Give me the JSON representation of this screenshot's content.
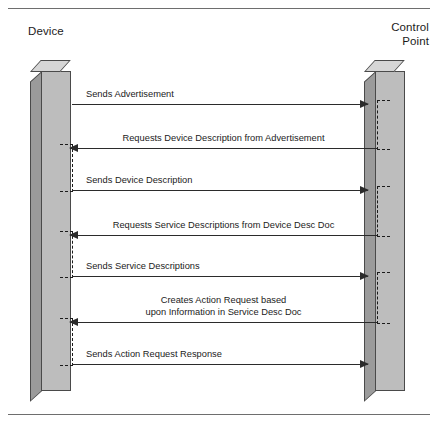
{
  "figure": {
    "type": "sequence-diagram",
    "frame": {
      "top_rule": true,
      "bottom_rule": true,
      "rule_color": "#6e6e6e"
    },
    "background_color": "#ffffff"
  },
  "actors": [
    {
      "id": "device",
      "label": "Device",
      "side": "left",
      "lifeline_style": "3d-box"
    },
    {
      "id": "control_point",
      "label": "Control\nPoint",
      "side": "right",
      "lifeline_style": "3d-box"
    }
  ],
  "colors": {
    "box_front": "#bdbdbd",
    "box_top": "#d6d6d6",
    "box_side": "#9b9b9b",
    "box_outline": "#4a4a4a",
    "arrow": "#2b2b2b",
    "text": "#1b1b1b"
  },
  "messages": [
    {
      "index": 1,
      "label": "Sends Advertisement",
      "from": "device",
      "to": "control_point",
      "direction": "right",
      "label_align": "left"
    },
    {
      "index": 2,
      "label": "Requests Device Description from Advertisement",
      "from": "control_point",
      "to": "device",
      "direction": "left",
      "label_align": "center"
    },
    {
      "index": 3,
      "label": "Sends Device Description",
      "from": "device",
      "to": "control_point",
      "direction": "right",
      "label_align": "left"
    },
    {
      "index": 4,
      "label": "Requests Service Descriptions from Device Desc Doc",
      "from": "control_point",
      "to": "device",
      "direction": "left",
      "label_align": "center"
    },
    {
      "index": 5,
      "label": "Sends Service Descriptions",
      "from": "device",
      "to": "control_point",
      "direction": "right",
      "label_align": "left"
    },
    {
      "index": 6,
      "label": "Creates Action Request based\nupon Information in Service Desc Doc",
      "from": "control_point",
      "to": "device",
      "direction": "left",
      "label_align": "center"
    },
    {
      "index": 7,
      "label": "Sends Action Request Response",
      "from": "device",
      "to": "control_point",
      "direction": "right",
      "label_align": "left"
    }
  ]
}
